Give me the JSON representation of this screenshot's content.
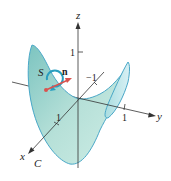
{
  "diagram": {
    "surface_label": "S",
    "normal_label": "n",
    "curve_label": "C",
    "axes": {
      "x_label": "x",
      "y_label": "y",
      "z_label": "z"
    },
    "ticks": {
      "z_tick": "1",
      "x_tick": "1",
      "y_tick": "1",
      "neg_x_tick": "−1"
    },
    "colors": {
      "surface_fill": "#a8d8d4",
      "surface_edge": "#4aa8c8",
      "normal_arrow": "#d9534f",
      "orientation_circle": "#2a9fc0",
      "axis": "#333333"
    }
  }
}
